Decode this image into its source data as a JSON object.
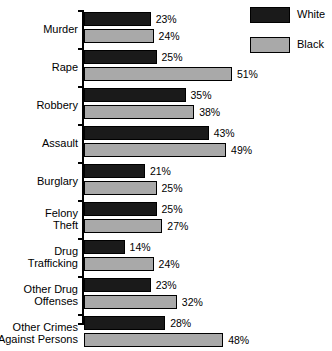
{
  "chart_data": {
    "type": "bar",
    "orientation": "horizontal",
    "title": "",
    "subtitle": "",
    "xlabel": "",
    "ylabel": "",
    "xlim": [
      0,
      55
    ],
    "grid": false,
    "value_suffix": "%",
    "legend": {
      "position": "top-right",
      "entries": [
        {
          "name": "White",
          "color": "#1a1a1a"
        },
        {
          "name": "Black",
          "color": "#a9a9a9"
        }
      ]
    },
    "categories": [
      "Murder",
      "Rape",
      "Robbery",
      "Assault",
      "Burglary",
      "Felony\nTheft",
      "Drug\nTrafficking",
      "Other Drug\nOffenses",
      "Other Crimes\nAgainst Persons"
    ],
    "series": [
      {
        "name": "White",
        "color": "#1a1a1a",
        "values": [
          23,
          25,
          35,
          43,
          21,
          25,
          14,
          23,
          28
        ],
        "labels": [
          "23%",
          "25%",
          "35%",
          "43%",
          "21%",
          "25%",
          "14%",
          "23%",
          "28%"
        ]
      },
      {
        "name": "Black",
        "color": "#a9a9a9",
        "values": [
          24,
          51,
          38,
          49,
          25,
          27,
          24,
          32,
          48
        ],
        "labels": [
          "24%",
          "51%",
          "38%",
          "49%",
          "25%",
          "27%",
          "24%",
          "32%",
          "48%"
        ]
      }
    ]
  },
  "legend": {
    "items": [
      {
        "label": "White"
      },
      {
        "label": "Black"
      }
    ]
  },
  "groups": [
    {
      "category": "Murder",
      "white": {
        "value": 23,
        "label": "23%"
      },
      "black": {
        "value": 24,
        "label": "24%"
      }
    },
    {
      "category": "Rape",
      "white": {
        "value": 25,
        "label": "25%"
      },
      "black": {
        "value": 51,
        "label": "51%"
      }
    },
    {
      "category": "Robbery",
      "white": {
        "value": 35,
        "label": "35%"
      },
      "black": {
        "value": 38,
        "label": "38%"
      }
    },
    {
      "category": "Assault",
      "white": {
        "value": 43,
        "label": "43%"
      },
      "black": {
        "value": 49,
        "label": "49%"
      }
    },
    {
      "category": "Burglary",
      "white": {
        "value": 21,
        "label": "21%"
      },
      "black": {
        "value": 25,
        "label": "25%"
      }
    },
    {
      "category": "Felony\nTheft",
      "white": {
        "value": 25,
        "label": "25%"
      },
      "black": {
        "value": 27,
        "label": "27%"
      }
    },
    {
      "category": "Drug\nTrafficking",
      "white": {
        "value": 14,
        "label": "14%"
      },
      "black": {
        "value": 24,
        "label": "24%"
      }
    },
    {
      "category": "Other Drug\nOffenses",
      "white": {
        "value": 23,
        "label": "23%"
      },
      "black": {
        "value": 32,
        "label": "32%"
      }
    },
    {
      "category": "Other Crimes\nAgainst Persons",
      "white": {
        "value": 28,
        "label": "28%"
      },
      "black": {
        "value": 48,
        "label": "48%"
      }
    }
  ],
  "scale": {
    "px_per_unit": 2.9
  },
  "colors": {
    "white_series": "#1a1a1a",
    "black_series": "#a9a9a9",
    "axis": "#000000",
    "background": "#ffffff"
  }
}
